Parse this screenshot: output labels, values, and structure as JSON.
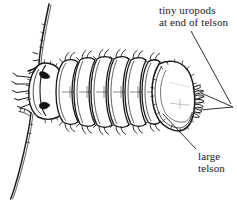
{
  "figure": {
    "background_color": "#ffffff",
    "ink_color": "#1a1a1a",
    "width": 237,
    "height": 201
  },
  "annotations": {
    "uropods": {
      "line1": "tiny uropods",
      "line2": "at end of telson",
      "pointer": "forked-v-leader-line"
    },
    "telson": {
      "line1": "large",
      "line2": "telson",
      "pointer": "straight-leader-line"
    }
  },
  "organism": {
    "parts": [
      "antenna-upper",
      "antenna-lower",
      "head",
      "eye-left",
      "eye-right",
      "pereon-segments",
      "telson",
      "uropods",
      "legs"
    ],
    "segment_count": 7
  }
}
